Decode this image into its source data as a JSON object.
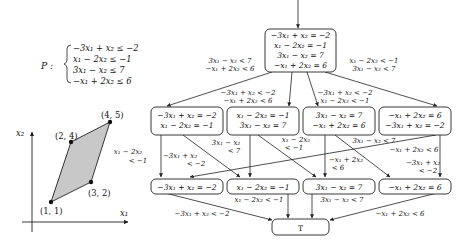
{
  "system": {
    "label": "P :",
    "constraints": [
      "−3x₁ + x₂ ≤ −2",
      "x₁ − 2x₂ ≤ −1",
      "3x₁ − x₂ ≤ 7",
      "−x₁ + 2x₂ ≤ 6"
    ]
  },
  "plot": {
    "xlabel": "x₁",
    "ylabel": "x₂",
    "vertices": [
      {
        "label": "(1, 1)"
      },
      {
        "label": "(3, 2)"
      },
      {
        "label": "(4, 5)"
      },
      {
        "label": "(2, 4)"
      }
    ],
    "fill_color": "#c8c8c8"
  },
  "lattice": {
    "top": {
      "lines": [
        "−3x₁ + x₂ = −2",
        "x₁ − 2x₂ = −1",
        "3x₁ − x₂ = 7",
        "−x₁ + 2x₂ = 6"
      ]
    },
    "top_edge_labels": {
      "left": [
        "3x₁ − x₂ < 7",
        "−x₁ + 2x₂ < 6"
      ],
      "right": [
        "x₁ − 2x₂ < −1",
        "3x₁ − x₂ < 7"
      ],
      "inner_left": [
        "−3x₁ + x₂ < −2",
        "−x₁ + 2x₂ < 6"
      ],
      "inner_right": [
        "−3x₁ + x₂ < −2",
        "x₁ − 2x₂ < −1"
      ]
    },
    "middle": [
      {
        "lines": [
          "−3x₁ + x₂ = −2",
          "x₁ − 2x₂ = −1"
        ]
      },
      {
        "lines": [
          "x₁ − 2x₂ = −1",
          "3x₁ − x₂ = 7"
        ]
      },
      {
        "lines": [
          "3x₁ − x₂ = 7",
          "−x₁ + 2x₂ = 6"
        ]
      },
      {
        "lines": [
          "−x₁ + 2x₂ = 6",
          "−3x₁ + x₂ = −2"
        ]
      }
    ],
    "middle_edge_labels": [
      [
        "x₁ − 2x₂",
        "< −1"
      ],
      [
        "−3x₁ + x₂",
        "< −2"
      ],
      [
        "3x₁ − x₂",
        "< 7"
      ],
      [
        "x₁ − 2x₂",
        "< −1"
      ],
      [
        "3x₁ − x₂ < 7"
      ],
      [
        "−x₁ + 2x₂ < 6"
      ],
      [
        "−x₁ + 2x₂",
        "< 6"
      ],
      [
        "−3x₁ + x₂",
        "< −2"
      ]
    ],
    "bottom": [
      {
        "lines": [
          "−3x₁ + x₂ = −2"
        ]
      },
      {
        "lines": [
          "x₁ − 2x₂ = −1"
        ]
      },
      {
        "lines": [
          "3x₁ − x₂ = 7"
        ]
      },
      {
        "lines": [
          "−x₁ + 2x₂ = 6"
        ]
      }
    ],
    "bottom_edge_labels": [
      "−3x₁ + x₂ < −2",
      "x₁ − 2x₂ < −1",
      "3x₁ − x₂ < 7",
      "−x₁ + 2x₂ < 6"
    ],
    "top_node_label": "T"
  }
}
